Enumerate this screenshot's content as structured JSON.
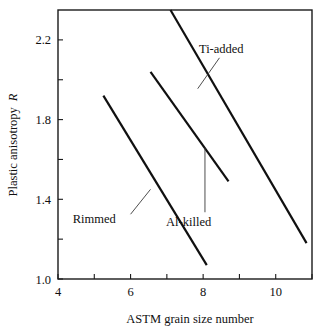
{
  "chart_data": {
    "type": "line",
    "title": "",
    "xlabel": "ASTM grain size number",
    "ylabel": "Plastic anisotropy R",
    "ylabel_plain": "Plastic anisotropy",
    "ylabel_italic": "R",
    "xlim": [
      4,
      11
    ],
    "ylim": [
      1.0,
      2.35
    ],
    "grid": false,
    "legend": "inline annotations",
    "xticks": [
      4,
      5,
      6,
      7,
      8,
      9,
      10,
      11
    ],
    "xtick_labels": [
      "4",
      "",
      "6",
      "",
      "8",
      "",
      "10",
      ""
    ],
    "yticks": [
      1.0,
      1.2,
      1.4,
      1.6,
      1.8,
      2.0,
      2.2
    ],
    "ytick_labels": [
      "1.0",
      "",
      "1.4",
      "",
      "1.8",
      "",
      "2.2"
    ],
    "series": [
      {
        "name": "Rimmed",
        "x": [
          5.25,
          8.1
        ],
        "values": [
          1.92,
          1.07
        ],
        "label_x": 5.0,
        "label_y": 1.28,
        "leader": {
          "x1": 6.0,
          "y1": 1.325,
          "x2": 6.55,
          "y2": 1.45
        }
      },
      {
        "name": "Al-killed",
        "x": [
          6.55,
          8.7
        ],
        "values": [
          2.04,
          1.49
        ],
        "label_x": 7.6,
        "label_y": 1.265,
        "leader": {
          "x1": 8.05,
          "y1": 1.335,
          "x2": 8.05,
          "y2": 1.66
        }
      },
      {
        "name": "Ti-added",
        "x": [
          7.1,
          10.85
        ],
        "values": [
          2.35,
          1.18
        ],
        "label_x": 8.5,
        "label_y": 2.135,
        "leader": {
          "x1": 8.45,
          "y1": 2.11,
          "x2": 7.85,
          "y2": 1.955
        }
      }
    ]
  },
  "colors": {
    "axis": "#1a1a1a",
    "line": "#101010",
    "leader": "#3a3a3a",
    "background": "#ffffff"
  }
}
